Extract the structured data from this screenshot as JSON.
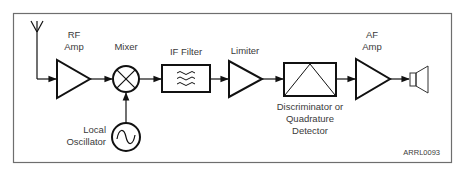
{
  "diagram": {
    "type": "block-diagram",
    "figure_id": "ARRL0093",
    "colors": {
      "stroke": "#111111",
      "frame": "#6e6e6e",
      "text": "#3a3a3a",
      "background": "#ffffff"
    },
    "blocks": [
      {
        "id": "antenna",
        "label": ""
      },
      {
        "id": "rf_amp",
        "label_line1": "RF",
        "label_line2": "Amp"
      },
      {
        "id": "mixer",
        "label": "Mixer"
      },
      {
        "id": "local_osc",
        "label_line1": "Local",
        "label_line2": "Oscillator"
      },
      {
        "id": "if_filter",
        "label": "IF Filter"
      },
      {
        "id": "limiter",
        "label": "Limiter"
      },
      {
        "id": "discriminator",
        "label_line1": "Discriminator or",
        "label_line2": "Quadrature",
        "label_line3": "Detector"
      },
      {
        "id": "af_amp",
        "label_line1": "AF",
        "label_line2": "Amp"
      },
      {
        "id": "speaker",
        "label": ""
      }
    ],
    "connections": [
      [
        "antenna",
        "rf_amp"
      ],
      [
        "rf_amp",
        "mixer"
      ],
      [
        "local_osc",
        "mixer"
      ],
      [
        "mixer",
        "if_filter"
      ],
      [
        "if_filter",
        "limiter"
      ],
      [
        "limiter",
        "discriminator"
      ],
      [
        "discriminator",
        "af_amp"
      ],
      [
        "af_amp",
        "speaker"
      ]
    ]
  }
}
